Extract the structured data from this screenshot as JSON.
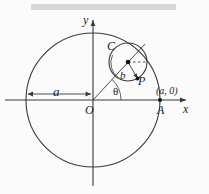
{
  "figure": {
    "kind": "geometry-diagram",
    "banner": "",
    "colors": {
      "stroke": "#3a3a3a",
      "background": "#fbfbfb",
      "banner": "#d8d8d8",
      "point": "#111111"
    },
    "labels": {
      "y_axis": "y",
      "x_axis": "x",
      "origin": "O",
      "point_A": "A",
      "point_A_coords": "(a, 0)",
      "radius_big": "a",
      "circle_center": "C",
      "radius_small": "b",
      "point_P": "P",
      "angle": "θ"
    }
  },
  "geometry": {
    "big_circle": {
      "cx": 93,
      "cy": 100,
      "r": 67
    },
    "small_circle": {
      "cx": 128,
      "cy": 62,
      "r": 19
    },
    "origin": {
      "x": 93,
      "y": 100
    },
    "point_A": {
      "x": 160,
      "y": 100
    },
    "point_P": {
      "x": 137,
      "y": 77
    },
    "center_dot": {
      "x": 128,
      "y": 62
    },
    "angle_theta_degrees": 47,
    "dimension_a": {
      "from_x": 27,
      "to_x": 92,
      "y": 94
    }
  }
}
